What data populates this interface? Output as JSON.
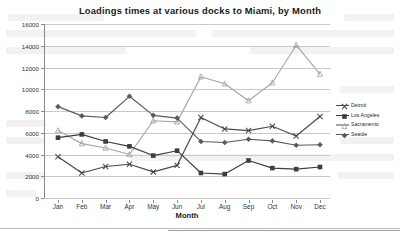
{
  "chart_data": {
    "type": "line",
    "title": "Loadings times at various docks to Miami, by Month",
    "xlabel": "Month",
    "ylabel": "Time in Hours",
    "categories": [
      "Jan",
      "Feb",
      "Mar",
      "Apr",
      "May",
      "Jun",
      "Jul",
      "Aug",
      "Sep",
      "Oct",
      "Nov",
      "Dec"
    ],
    "ylim": [
      0,
      16000
    ],
    "yticks": [
      0,
      2000,
      4000,
      6000,
      8000,
      10000,
      12000,
      14000,
      16000
    ],
    "ytick_labels": [
      "0",
      "2000",
      "4000",
      "6000",
      "8000",
      "10000",
      "12000",
      "14000",
      "16000"
    ],
    "grid": true,
    "legend_position": "right",
    "series": [
      {
        "name": "Detroit",
        "marker": "x-marker",
        "color": "#4a4a4a",
        "values": [
          3800,
          2300,
          2900,
          3100,
          2400,
          3000,
          7400,
          6350,
          6200,
          6600,
          5700,
          7500
        ]
      },
      {
        "name": "Los Angeles",
        "marker": "square-marker",
        "color": "#3d3d3d",
        "values": [
          5550,
          5850,
          5200,
          4750,
          3900,
          4350,
          2300,
          2200,
          3450,
          2750,
          2650,
          2850
        ]
      },
      {
        "name": "Sacramento",
        "marker": "triangle-marker",
        "color": "#a6a6a6",
        "values": [
          6200,
          5000,
          4600,
          4000,
          7100,
          7000,
          11150,
          10500,
          8950,
          10600,
          14050,
          11400
        ]
      },
      {
        "name": "Seattle",
        "marker": "diamond-marker",
        "color": "#5a5a5a",
        "values": [
          8400,
          7550,
          7400,
          9350,
          7600,
          7350,
          5200,
          5100,
          5400,
          5250,
          4850,
          4900
        ]
      }
    ]
  }
}
